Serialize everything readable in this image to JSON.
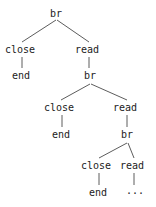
{
  "figure": {
    "kind": "recursive-syntax-tree",
    "width": 156,
    "height": 207,
    "background_color": "#ffffff",
    "text_color": "#1c1c1c",
    "edge_color": "#4a4a4a"
  },
  "nodes": {
    "root_br": "br",
    "l1_close": "close",
    "l1_read": "read",
    "l2_end": "end",
    "l2_br": "br",
    "l3_close": "close",
    "l3_read": "read",
    "l4_end": "end",
    "l4_br": "br",
    "l5_close": "close",
    "l5_read": "read",
    "l6_end": "end",
    "l6_ellipsis": "···"
  },
  "tree": {
    "label": "br",
    "children": [
      {
        "label": "close",
        "children": [
          {
            "label": "end",
            "children": []
          }
        ]
      },
      {
        "label": "read",
        "children": [
          {
            "label": "br",
            "children": [
              {
                "label": "close",
                "children": [
                  {
                    "label": "end",
                    "children": []
                  }
                ]
              },
              {
                "label": "read",
                "children": [
                  {
                    "label": "br",
                    "children": [
                      {
                        "label": "close",
                        "children": [
                          {
                            "label": "end",
                            "children": []
                          }
                        ]
                      },
                      {
                        "label": "read",
                        "children": [
                          {
                            "label": "···",
                            "children": []
                          }
                        ]
                      }
                    ]
                  }
                ]
              }
            ]
          }
        ]
      }
    ]
  }
}
